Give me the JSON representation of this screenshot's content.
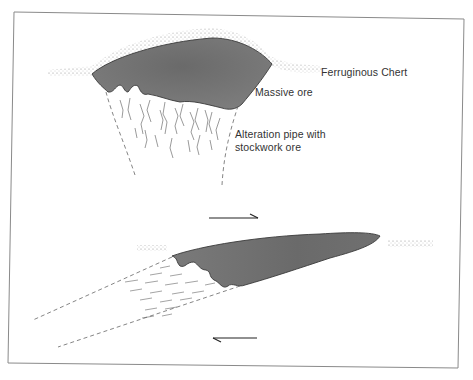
{
  "figure": {
    "type": "geological cross-section diagram",
    "panels": [
      {
        "id": "upper",
        "description": "Undeformed volcanogenic massive sulphide deposit",
        "labels": {
          "chert": "Ferruginous Chert",
          "massive_ore": "Massive ore",
          "alteration_line1": "Alteration pipe with",
          "alteration_line2": "stockwork ore"
        },
        "shear_arrow": "right"
      },
      {
        "id": "lower",
        "description": "Sheared / deformed deposit with flattened ore body and alteration pipe",
        "shear_arrows": [
          "right (top)",
          "left (bottom)"
        ]
      }
    ],
    "colors": {
      "ore_fill": "#6e6e6e",
      "ore_fill_light": "#8a8a8a",
      "stipple": "#9a9a9a",
      "line": "#444444",
      "border": "#888888",
      "text": "#333333"
    }
  }
}
